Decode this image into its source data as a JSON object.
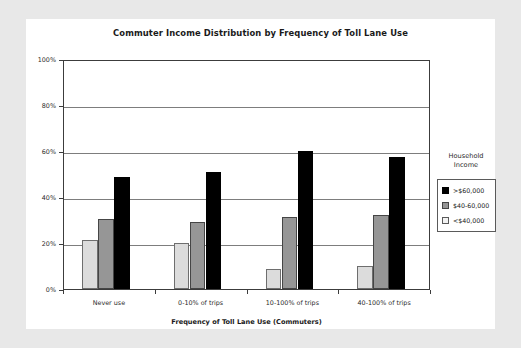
{
  "chart_data": {
    "type": "bar",
    "title": "Commuter Income Distribution by Frequency of Toll Lane Use",
    "xlabel": "Frequency of Toll Lane Use (Commuters)",
    "ylabel": "",
    "categories": [
      "Never use",
      "0-10% of trips",
      "10-100% of trips",
      "40-100% of trips"
    ],
    "series": [
      {
        "name": ">$60,000",
        "key": "s-high",
        "color": "#000000",
        "values": [
          48.5,
          51.0,
          60.0,
          57.5
        ]
      },
      {
        "name": "$40-60,000",
        "key": "s-mid",
        "color": "#969696",
        "values": [
          30.5,
          29.0,
          31.5,
          32.0
        ]
      },
      {
        "name": "<$40,000",
        "key": "s-low",
        "color": "#dcdcdc",
        "values": [
          21.5,
          20.0,
          8.5,
          10.0
        ]
      }
    ],
    "series_order_in_plot": [
      "s-low",
      "s-mid",
      "s-high"
    ],
    "ylim": [
      0,
      100
    ],
    "yticks": [
      0,
      20,
      40,
      60,
      80,
      100
    ],
    "ytick_labels": [
      "0%",
      "20%",
      "40%",
      "60%",
      "80%",
      "100%"
    ],
    "grid": true,
    "legend_position": "right",
    "legend_title": "Household Income"
  },
  "legend": {
    "title_line1": "Household",
    "title_line2": "Income",
    "entries": [
      {
        "label": ">$60,000",
        "key": "s-high"
      },
      {
        "label": "$40-60,000",
        "key": "s-mid"
      },
      {
        "label": "<$40,000",
        "key": "s-low"
      }
    ]
  }
}
